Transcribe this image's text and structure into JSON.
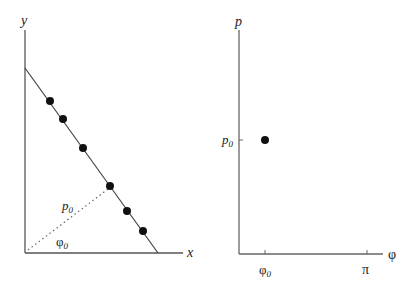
{
  "left_panel": {
    "y_axis_label": "y",
    "x_axis_label": "x",
    "distance_label": "p",
    "distance_subscript": "0",
    "angle_label": "φ",
    "angle_subscript": "0",
    "line": {
      "x1": 25,
      "y1": 68,
      "x2": 158,
      "y2": 253
    },
    "points": [
      {
        "cx": 50,
        "cy": 101
      },
      {
        "cx": 63,
        "cy": 119
      },
      {
        "cx": 83,
        "cy": 148
      },
      {
        "cx": 110,
        "cy": 186
      },
      {
        "cx": 127,
        "cy": 211
      },
      {
        "cx": 143,
        "cy": 231
      }
    ]
  },
  "right_panel": {
    "y_axis_label": "p",
    "x_axis_label": "φ",
    "y_tick_label": "p",
    "y_tick_subscript": "0",
    "x_tick_labels": [
      {
        "text": "φ",
        "subscript": "0"
      },
      {
        "text": "π",
        "subscript": ""
      }
    ],
    "point": {
      "cx": 265,
      "cy": 140
    }
  }
}
